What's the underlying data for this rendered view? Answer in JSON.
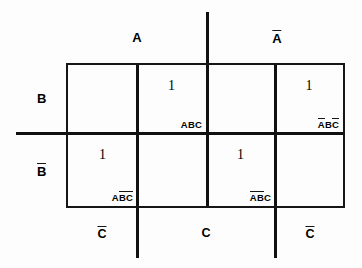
{
  "diagram": {
    "type": "veitch-karnaugh-map",
    "variables": [
      "A",
      "B",
      "C"
    ],
    "top_labels": [
      {
        "text": "A",
        "overbar": false,
        "x_center": 137
      },
      {
        "text": "A",
        "overbar": true,
        "x_center": 276
      }
    ],
    "left_labels": [
      {
        "text": "B",
        "overbar": false,
        "y_center": 98
      },
      {
        "text": "B",
        "overbar": true,
        "y_center": 171
      }
    ],
    "bottom_labels": [
      {
        "text": "C",
        "overbar": true,
        "x_center": 102
      },
      {
        "text": "C",
        "overbar": false,
        "x_center": 206
      },
      {
        "text": "C",
        "overbar": true,
        "x_center": 310
      }
    ],
    "cells": [
      {
        "row": "B",
        "col": 1,
        "value": "",
        "minterm": []
      },
      {
        "row": "B",
        "col": 2,
        "value": "1",
        "minterm": [
          {
            "v": "A",
            "bar": false
          },
          {
            "v": "B",
            "bar": false
          },
          {
            "v": "C",
            "bar": false
          }
        ]
      },
      {
        "row": "B",
        "col": 3,
        "value": "",
        "minterm": []
      },
      {
        "row": "B",
        "col": 4,
        "value": "1",
        "minterm": [
          {
            "v": "A",
            "bar": true
          },
          {
            "v": "B",
            "bar": false
          },
          {
            "v": "C",
            "bar": true
          }
        ]
      },
      {
        "row": "Bb",
        "col": 1,
        "value": "1",
        "minterm": [
          {
            "v": "A",
            "bar": false
          },
          {
            "v": "B",
            "bar": true
          },
          {
            "v": "C",
            "bar": true
          }
        ]
      },
      {
        "row": "Bb",
        "col": 2,
        "value": "",
        "minterm": []
      },
      {
        "row": "Bb",
        "col": 3,
        "value": "1",
        "minterm": [
          {
            "v": "A",
            "bar": true
          },
          {
            "v": "B",
            "bar": true
          },
          {
            "v": "C",
            "bar": false
          }
        ]
      },
      {
        "row": "Bb",
        "col": 4,
        "value": "",
        "minterm": []
      }
    ],
    "ones": {
      "top_row_2": "1",
      "top_row_4": "1",
      "bottom_row_1": "1",
      "bottom_row_3": "1"
    },
    "minterm_text": {
      "top_row_2": "ABC",
      "top_row_4": "ABC",
      "bottom_row_1": "ABC",
      "bottom_row_3": "ABC"
    },
    "colors": {
      "ink": "#161616",
      "background": "#ffffff"
    }
  }
}
